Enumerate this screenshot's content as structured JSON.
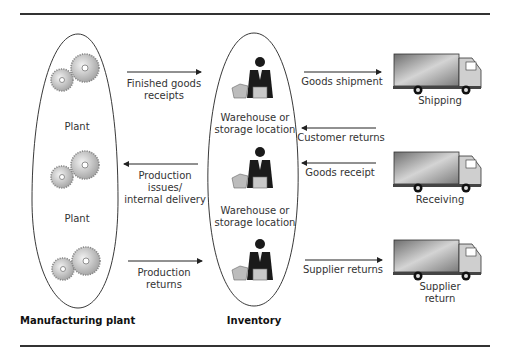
{
  "diagram": {
    "groups": {
      "manufacturing": {
        "title": "Manufacturing plant",
        "nodes": [
          "Plant",
          "Plant"
        ]
      },
      "inventory": {
        "title": "Inventory",
        "nodes": [
          "Warehouse or storage location",
          "Warehouse or storage location"
        ]
      }
    },
    "plant_labels": [
      "Plant",
      "Plant"
    ],
    "warehouse_labels": [
      {
        "line1": "Warehouse or",
        "line2": "storage location"
      },
      {
        "line1": "Warehouse or",
        "line2": "storage location"
      }
    ],
    "left_flows": [
      {
        "line1": "Finished goods",
        "line2": "receipts",
        "direction": "right"
      },
      {
        "line1": "Production",
        "line2": "issues/",
        "line3": "internal delivery",
        "direction": "left"
      },
      {
        "line1": "Production",
        "line2": "returns",
        "direction": "right"
      }
    ],
    "right_flows": [
      {
        "label": "Goods shipment",
        "direction": "right"
      },
      {
        "label": "Customer returns",
        "direction": "left"
      },
      {
        "label": "Goods receipt",
        "direction": "left"
      },
      {
        "label": "Supplier returns",
        "direction": "right"
      }
    ],
    "trucks": [
      {
        "line1": "Shipping",
        "line2": ""
      },
      {
        "line1": "Receiving",
        "line2": ""
      },
      {
        "line1": "Supplier",
        "line2": "return"
      }
    ],
    "icons": {
      "gear": "gear-icon",
      "person": "person-at-desk-icon",
      "truck": "truck-icon"
    },
    "colors": {
      "line": "#222222",
      "gear": "#bdbdbd",
      "truck_body": "#9a9a9a",
      "person": "#1a1a1a"
    }
  }
}
